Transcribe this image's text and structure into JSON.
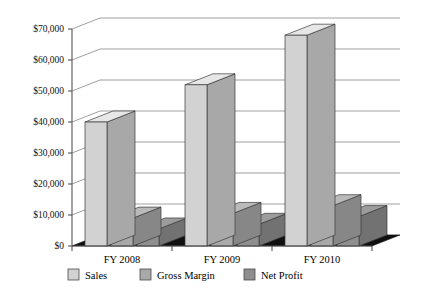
{
  "chart_data": {
    "type": "bar",
    "title": "",
    "subtitle": "",
    "xlabel": "",
    "ylabel": "",
    "categories": [
      "FY 2008",
      "FY 2009",
      "FY 2010"
    ],
    "series": [
      {
        "name": "Sales",
        "values": [
          40000,
          52000,
          68000
        ],
        "color": "#d2d2d2"
      },
      {
        "name": "Gross Margin",
        "values": [
          9000,
          10500,
          13000
        ],
        "color": "#a9a9a9"
      },
      {
        "name": "Net Profit",
        "values": [
          5500,
          7000,
          9500
        ],
        "color": "#8e8e8e"
      }
    ],
    "ylim": [
      0,
      70000
    ],
    "ytick_values": [
      0,
      10000,
      20000,
      30000,
      40000,
      50000,
      60000,
      70000
    ],
    "ytick_labels": [
      "$0",
      "$10,000",
      "$20,000",
      "$30,000",
      "$40,000",
      "$50,000",
      "$60,000",
      "$70,000"
    ],
    "grid": true,
    "grid_axis": "y",
    "legend_position": "bottom",
    "style": "3d-column",
    "floor_color": "#101010",
    "axis_color": "#555555",
    "grid_color": "#888888"
  },
  "legend": {
    "items": [
      {
        "label": "Sales"
      },
      {
        "label": "Gross Margin"
      },
      {
        "label": "Net Profit"
      }
    ]
  },
  "axis": {
    "y_labels": [
      "$70,000",
      "$60,000",
      "$50,000",
      "$40,000",
      "$30,000",
      "$20,000",
      "$10,000",
      "$0"
    ],
    "x_labels": [
      "FY 2008",
      "FY 2009",
      "FY 2010"
    ]
  }
}
